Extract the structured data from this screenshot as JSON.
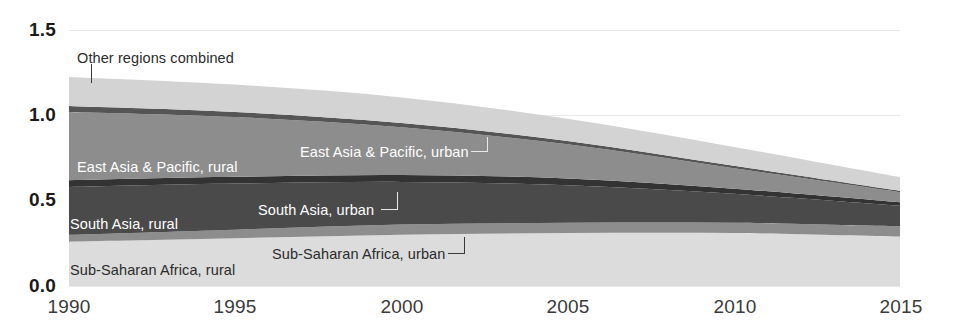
{
  "chart_data": {
    "type": "area",
    "title": "",
    "subtitle": "",
    "xlabel": "",
    "ylabel": "",
    "xlim": [
      1990,
      2015
    ],
    "ylim": [
      0.0,
      1.5
    ],
    "grid": true,
    "legend_position": "inline-labels",
    "x": [
      1990,
      1995,
      2000,
      2005,
      2010,
      2015
    ],
    "x_tick_labels": [
      "1990",
      "1995",
      "2000",
      "2005",
      "2010",
      "2015"
    ],
    "y_tick_labels": [
      "0.0",
      "0.5",
      "1.0",
      "1.5"
    ],
    "y_ticks": [
      0.0,
      0.5,
      1.0,
      1.5
    ],
    "stacked": true,
    "series": [
      {
        "name": "Sub-Saharan Africa, rural",
        "color": "#dcdcdc",
        "label_color": "dark",
        "values": [
          0.26,
          0.28,
          0.3,
          0.31,
          0.31,
          0.29
        ]
      },
      {
        "name": "Sub-Saharan Africa, urban",
        "color": "#8d8d8d",
        "label_color": "dark",
        "values": [
          0.04,
          0.05,
          0.06,
          0.06,
          0.06,
          0.06
        ]
      },
      {
        "name": "South Asia, rural",
        "color": "#4a4a4a",
        "label_color": "light",
        "values": [
          0.28,
          0.27,
          0.25,
          0.22,
          0.17,
          0.12
        ]
      },
      {
        "name": "South Asia, urban",
        "color": "#333333",
        "label_color": "light",
        "values": [
          0.04,
          0.04,
          0.04,
          0.04,
          0.03,
          0.02
        ]
      },
      {
        "name": "East Asia & Pacific, rural",
        "color": "#8d8d8d",
        "label_color": "light",
        "values": [
          0.4,
          0.35,
          0.28,
          0.2,
          0.12,
          0.06
        ]
      },
      {
        "name": "East Asia & Pacific, urban",
        "color": "#555555",
        "label_color": "light",
        "values": [
          0.035,
          0.03,
          0.025,
          0.02,
          0.015,
          0.008
        ]
      },
      {
        "name": "Other regions combined",
        "color": "#d3d3d3",
        "label_color": "dark",
        "values": [
          0.17,
          0.16,
          0.15,
          0.13,
          0.11,
          0.08
        ]
      }
    ],
    "annotations": [
      {
        "id": "other-regions-combined",
        "text": "Other regions combined"
      },
      {
        "id": "east-asia-pacific-rural",
        "text": "East Asia & Pacific, rural"
      },
      {
        "id": "east-asia-pacific-urban",
        "text": "East Asia & Pacific, urban"
      },
      {
        "id": "south-asia-rural",
        "text": "South Asia, rural"
      },
      {
        "id": "south-asia-urban",
        "text": "South Asia, urban"
      },
      {
        "id": "sub-saharan-africa-rural",
        "text": "Sub-Saharan Africa, rural"
      },
      {
        "id": "sub-saharan-africa-urban",
        "text": "Sub-Saharan Africa, urban"
      }
    ]
  },
  "axis": {
    "y_labels": [
      "1.5",
      "1.0",
      "0.5",
      "0.0"
    ],
    "x_labels": [
      "1990",
      "1995",
      "2000",
      "2005",
      "2010",
      "2015"
    ]
  },
  "colors": {
    "background": "#ffffff",
    "gridline": "#e9e9e9",
    "tick_text": "#1a1a1a",
    "leader_line": "#3a3a3a"
  }
}
